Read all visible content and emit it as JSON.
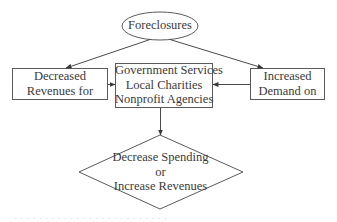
{
  "diagram": {
    "type": "flowchart",
    "colors": {
      "stroke": "#5a5a5a",
      "text": "#3a3a3a",
      "background": "#ffffff"
    },
    "nodes": {
      "foreclosures": {
        "shape": "ellipse",
        "label": "Foreclosures"
      },
      "decreased_revenues": {
        "shape": "rectangle",
        "lines": [
          "Decreased",
          "Revenues for"
        ]
      },
      "agencies": {
        "shape": "rectangle",
        "lines": [
          "Government Services",
          "Local Charities",
          "Nonprofit Agencies"
        ]
      },
      "increased_demand": {
        "shape": "rectangle",
        "lines": [
          "Increased",
          "Demand on"
        ]
      },
      "decision": {
        "shape": "diamond",
        "lines": [
          "Decrease Spending",
          "or",
          "Increase Revenues"
        ]
      }
    },
    "edges": [
      {
        "from": "foreclosures",
        "to": "decreased_revenues"
      },
      {
        "from": "foreclosures",
        "to": "increased_demand"
      },
      {
        "from": "decreased_revenues",
        "to": "agencies"
      },
      {
        "from": "increased_demand",
        "to": "agencies"
      },
      {
        "from": "agencies",
        "to": "decision"
      }
    ],
    "caption": "· · · · · · · · · · · · · · · · · · · · · · · · ·"
  }
}
